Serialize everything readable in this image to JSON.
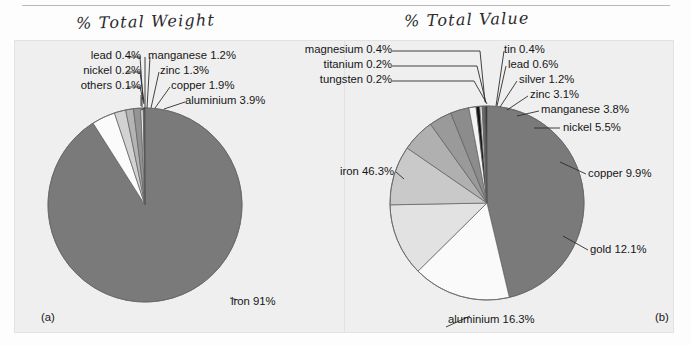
{
  "page": {
    "background": "#fdfdfd",
    "panel_background": "#efefef"
  },
  "figures": [
    {
      "id": "a",
      "tag": "(a)",
      "handwritten_title": "% Total Weight",
      "panel_label": "percent-total-weight"
    },
    {
      "id": "b",
      "tag": "(b)",
      "handwritten_title": "% Total Value",
      "panel_label": "percent-total-value"
    }
  ],
  "labels_a": {
    "lead": "lead 0.4%",
    "nickel": "nickel 0.2%",
    "others": "others 0.1%",
    "manganese": "manganese 1.2%",
    "zinc": "zinc 1.3%",
    "copper": "copper 1.9%",
    "aluminium": "aluminium 3.9%",
    "iron": "iron 91%"
  },
  "labels_b": {
    "magnesium": "magnesium 0.4%",
    "titanium": "titanium 0.2%",
    "tungsten": "tungsten 0.2%",
    "tin": "tin 0.4%",
    "lead": "lead 0.6%",
    "silver": "silver 1.2%",
    "zinc": "zinc 3.1%",
    "manganese": "manganese 3.8%",
    "nickel": "nickel 5.5%",
    "copper": "copper 9.9%",
    "gold": "gold 12.1%",
    "aluminium": "aluminium 16.3%",
    "iron": "iron 46.3%"
  },
  "chart_data": [
    {
      "type": "pie",
      "title": "% Total Weight",
      "panel": "(a)",
      "categories": [
        "iron",
        "aluminium",
        "copper",
        "zinc",
        "manganese",
        "lead",
        "nickel",
        "others"
      ],
      "values": [
        91.0,
        3.9,
        1.9,
        1.3,
        1.2,
        0.4,
        0.2,
        0.1
      ],
      "labels": [
        "iron 91%",
        "aluminium 3.9%",
        "copper 1.9%",
        "zinc 1.3%",
        "manganese 1.2%",
        "lead 0.4%",
        "nickel 0.2%",
        "others 0.1%"
      ],
      "colors": [
        "#7a7a7a",
        "#fbfbfb",
        "#d2d2d2",
        "#b4b4b4",
        "#949494",
        "#f2f2f2",
        "#6e6e6e",
        "#111111"
      ],
      "start_angle_deg": 0,
      "direction": "clockwise",
      "legend": "none",
      "grid": false
    },
    {
      "type": "pie",
      "title": "% Total Value",
      "panel": "(b)",
      "categories": [
        "iron",
        "aluminium",
        "gold",
        "copper",
        "nickel",
        "manganese",
        "zinc",
        "silver",
        "lead",
        "tin",
        "magnesium",
        "titanium",
        "tungsten"
      ],
      "values": [
        46.3,
        16.3,
        12.1,
        9.9,
        5.5,
        3.8,
        3.1,
        1.2,
        0.6,
        0.4,
        0.4,
        0.2,
        0.2
      ],
      "labels": [
        "iron 46.3%",
        "aluminium 16.3%",
        "gold 12.1%",
        "copper 9.9%",
        "nickel 5.5%",
        "manganese 3.8%",
        "zinc 3.1%",
        "silver 1.2%",
        "lead 0.6%",
        "tin 0.4%",
        "magnesium 0.4%",
        "titanium 0.2%",
        "tungsten 0.2%"
      ],
      "colors": [
        "#7a7a7a",
        "#fafafa",
        "#e2e2e2",
        "#c9c9c9",
        "#b0b0b0",
        "#9a9a9a",
        "#8c8c8c",
        "#f4f4f4",
        "#151515",
        "#e8e8e8",
        "#6a6a6a",
        "#3a3a3a",
        "#111111"
      ],
      "start_angle_deg": 0,
      "direction": "clockwise",
      "legend": "none",
      "grid": false
    }
  ]
}
